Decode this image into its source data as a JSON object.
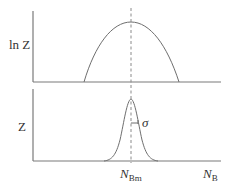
{
  "figure": {
    "top_panel": {
      "y_label": "ln Z",
      "curve": "inverted parabola (ln of gaussian)"
    },
    "bottom_panel": {
      "y_label": "Z",
      "curve": "gaussian peak",
      "width_label": "σ"
    },
    "x_axis": {
      "peak_label_main": "N",
      "peak_label_sub": "Bm",
      "axis_label_main": "N",
      "axis_label_sub": "B"
    },
    "colors": {
      "line": "#6e6e6e",
      "text": "#333333",
      "background": "#ffffff"
    }
  }
}
